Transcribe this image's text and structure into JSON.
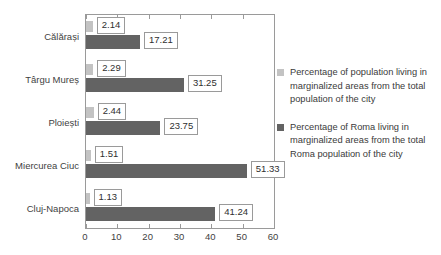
{
  "chart_data": {
    "type": "bar",
    "orientation": "horizontal",
    "title": "",
    "xlabel": "",
    "ylabel": "",
    "xlim": [
      0,
      60
    ],
    "xticks": [
      "0",
      "10",
      "20",
      "30",
      "40",
      "50",
      "60"
    ],
    "grid": false,
    "legend_position": "right",
    "categories": [
      "Călărași",
      "Târgu Mureș",
      "Ploiești",
      "Miercurea Ciuc",
      "Cluj-Napoca"
    ],
    "series": [
      {
        "name": "Percentage of population living in marginalized areas from the total population of the city",
        "color": "#c3c3c3",
        "values": [
          2.14,
          2.29,
          2.44,
          1.51,
          1.13
        ],
        "labels": [
          "2.14",
          "2.29",
          "2.44",
          "1.51",
          "1.13"
        ]
      },
      {
        "name": "Percentage of Roma living in marginalized areas from the total Roma population of the city",
        "color": "#636363",
        "values": [
          17.21,
          31.25,
          23.75,
          51.33,
          41.24
        ],
        "labels": [
          "17.21",
          "31.25",
          "23.75",
          "51.33",
          "41.24"
        ]
      }
    ]
  },
  "legend": {
    "entries": [
      {
        "swatch": "light",
        "text": "Percentage of population living in marginalized areas from the total population of the city"
      },
      {
        "swatch": "dark",
        "text": "Percentage of Roma living in marginalized areas from the total Roma population of the city"
      }
    ]
  },
  "colors": {
    "series_light": "#c3c3c3",
    "series_dark": "#636363",
    "axis": "#9a9a9a",
    "text": "#3a3a3a",
    "background": "#ffffff"
  }
}
